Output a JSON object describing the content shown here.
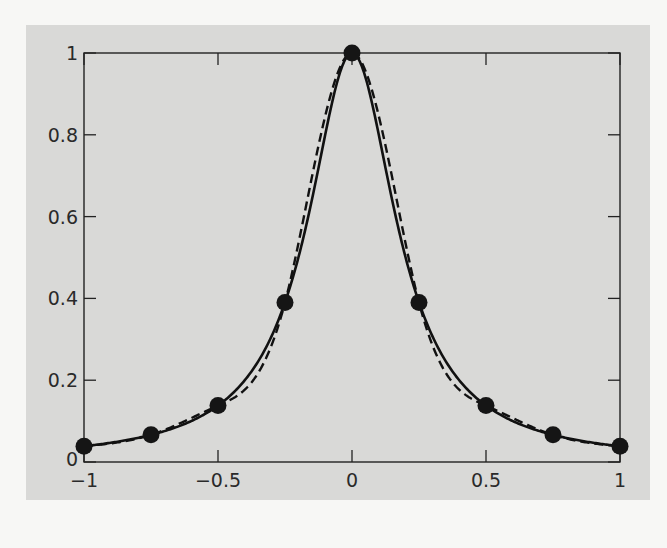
{
  "chart_data": {
    "type": "line",
    "title": "",
    "xlabel": "",
    "ylabel": "",
    "xlim": [
      -1,
      1
    ],
    "ylim": [
      0,
      1
    ],
    "grid": false,
    "legend": null,
    "x_ticks": [
      -1,
      -0.5,
      0,
      0.5,
      1
    ],
    "x_tick_labels": [
      "−1",
      "−0.5",
      "0",
      "0.5",
      "1"
    ],
    "y_ticks": [
      0,
      0.2,
      0.4,
      0.6,
      0.8,
      1
    ],
    "y_tick_labels": [
      "0",
      "0.2",
      "0.4",
      "0.6",
      "0.8",
      "1"
    ],
    "series": [
      {
        "name": "f(x) = 1/(1+25x^2)",
        "style": "solid",
        "color": "#111111",
        "function": "runge"
      },
      {
        "name": "interpolant",
        "style": "dashed",
        "color": "#111111",
        "function": "spline-through-points"
      },
      {
        "name": "data points",
        "style": "markers",
        "color": "#111111",
        "x": [
          -1,
          -0.75,
          -0.5,
          -0.25,
          0,
          0.25,
          0.5,
          0.75,
          1
        ],
        "y": [
          0.0385,
          0.0664,
          0.1379,
          0.3902,
          1.0,
          0.3902,
          0.1379,
          0.0664,
          0.0385
        ]
      }
    ]
  },
  "colors": {
    "panel_background": "#d9d9d7",
    "page_background": "#f7f7f5",
    "line": "#111111"
  }
}
